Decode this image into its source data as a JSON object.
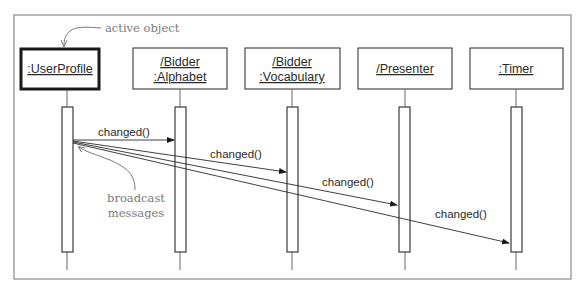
{
  "diagram": {
    "type": "UML sequence diagram",
    "objects": [
      {
        "id": "userprofile",
        "lines": [
          ":UserProfile"
        ],
        "active": true
      },
      {
        "id": "bidder-alphabet",
        "lines": [
          "/Bidder",
          ":Alphabet"
        ],
        "active": false
      },
      {
        "id": "bidder-vocabulary",
        "lines": [
          "/Bidder",
          ":Vocabulary"
        ],
        "active": false
      },
      {
        "id": "presenter",
        "lines": [
          "/Presenter"
        ],
        "active": false
      },
      {
        "id": "timer",
        "lines": [
          ":Timer"
        ],
        "active": false
      }
    ],
    "messages": [
      {
        "from": "userprofile",
        "to": "bidder-alphabet",
        "label": "changed()"
      },
      {
        "from": "userprofile",
        "to": "bidder-vocabulary",
        "label": "changed()"
      },
      {
        "from": "userprofile",
        "to": "presenter",
        "label": "changed()"
      },
      {
        "from": "userprofile",
        "to": "timer",
        "label": "changed()"
      }
    ],
    "annotations": {
      "active_object": "active object",
      "broadcast_line1": "broadcast",
      "broadcast_line2": "messages"
    },
    "colors": {
      "line": "#2a2a2a",
      "annotation": "#7a7a7a",
      "frame": "#8a8a8a"
    }
  }
}
